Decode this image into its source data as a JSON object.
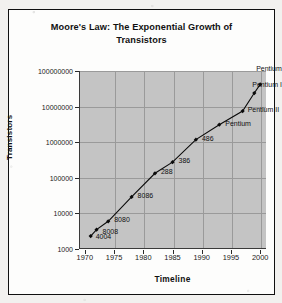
{
  "chart_data": {
    "type": "line",
    "title": "Moore's Law: The Exponential Growth of Transistors",
    "title_line1": "Moore's Law: The Exponential Growth of",
    "title_line2": "Transistors",
    "xlabel": "Timeline",
    "ylabel": "Transistors",
    "xlim": [
      1969,
      2001
    ],
    "ylim": [
      1000,
      100000000
    ],
    "yscale": "log",
    "grid": true,
    "legend": "none",
    "xticks": [
      "1970",
      "1975",
      "1980",
      "1985",
      "1990",
      "1995",
      "2000"
    ],
    "xtick_values": [
      1970,
      1975,
      1980,
      1985,
      1990,
      1995,
      2000
    ],
    "yticks": [
      "1000",
      "10000",
      "100000",
      "1000000",
      "10000000",
      "100000000"
    ],
    "ytick_values": [
      1000,
      10000,
      100000,
      1000000,
      10000000,
      100000000
    ],
    "series": [
      {
        "name": "Transistors per chip",
        "marker": "diamond",
        "color": "#0a0a0a",
        "points": [
          {
            "label": "4004",
            "x": 1971,
            "y": 2300,
            "label_dx": 5,
            "label_dy": 1
          },
          {
            "label": "8008",
            "x": 1972,
            "y": 3500,
            "label_dx": 6,
            "label_dy": 2
          },
          {
            "label": "8080",
            "x": 1974,
            "y": 6000,
            "label_dx": 6,
            "label_dy": -1
          },
          {
            "label": "8086",
            "x": 1978,
            "y": 29000,
            "label_dx": 6,
            "label_dy": -1
          },
          {
            "label": "288",
            "x": 1982,
            "y": 134000,
            "label_dx": 6,
            "label_dy": -1
          },
          {
            "label": "386",
            "x": 1985,
            "y": 275000,
            "label_dx": 6,
            "label_dy": -1
          },
          {
            "label": "486",
            "x": 1989,
            "y": 1180000,
            "label_dx": 6,
            "label_dy": -1
          },
          {
            "label": "Pentium",
            "x": 1993,
            "y": 3100000,
            "label_dx": 6,
            "label_dy": -1
          },
          {
            "label": "Pentium II",
            "x": 1997,
            "y": 7500000,
            "label_dx": 5,
            "label_dy": -1
          },
          {
            "label": "Pentium III",
            "x": 1999,
            "y": 24000000,
            "label_dx": -2,
            "label_dy": -8
          },
          {
            "label": "Pentium 4",
            "x": 2000,
            "y": 42000000,
            "label_dx": -4,
            "label_dy": -15
          }
        ]
      }
    ]
  },
  "colors": {
    "plot_background": "#c4c4c4",
    "card_background": "#fdfdfc",
    "line": "#0a0a0a",
    "grid": "#9a9a9a",
    "axis": "#3a3a3a",
    "text": "#111111"
  }
}
